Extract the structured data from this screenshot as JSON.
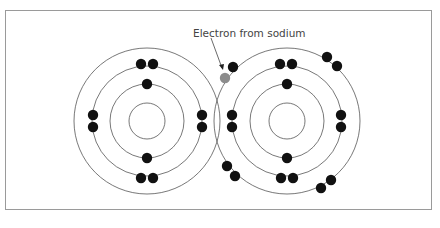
{
  "diagram": {
    "title": "",
    "label": "Electron from sodium",
    "colors": {
      "shell": "#555555",
      "electron": "#111111",
      "transferred_electron": "#8c8c8c",
      "frame": "#9a9a9a"
    },
    "atoms": [
      {
        "name": "sodium",
        "center": [
          147,
          121
        ],
        "shell_radii": [
          18,
          37,
          55,
          73
        ],
        "electrons": [
          [
            141,
            64
          ],
          [
            153,
            64
          ],
          [
            147,
            84
          ],
          [
            147,
            158
          ],
          [
            141,
            178
          ],
          [
            153,
            178
          ],
          [
            93,
            115
          ],
          [
            93,
            127
          ],
          [
            202,
            115
          ],
          [
            202,
            127
          ]
        ]
      },
      {
        "name": "chlorine",
        "center": [
          287,
          121
        ],
        "shell_radii": [
          18,
          37,
          55,
          73
        ],
        "electrons": [
          [
            280,
            64
          ],
          [
            292,
            64
          ],
          [
            287,
            84
          ],
          [
            287,
            158
          ],
          [
            281,
            178
          ],
          [
            293,
            178
          ],
          [
            232,
            115
          ],
          [
            232,
            127
          ],
          [
            341,
            115
          ],
          [
            341,
            127
          ],
          [
            233,
            67
          ],
          [
            327,
            57
          ],
          [
            337,
            66
          ],
          [
            227,
            166
          ],
          [
            235,
            176
          ],
          [
            331,
            180
          ],
          [
            321,
            188
          ]
        ]
      }
    ],
    "transferred_electron": [
      225,
      78
    ],
    "arrow": {
      "from": [
        211,
        38
      ],
      "to": [
        222,
        68
      ]
    }
  }
}
